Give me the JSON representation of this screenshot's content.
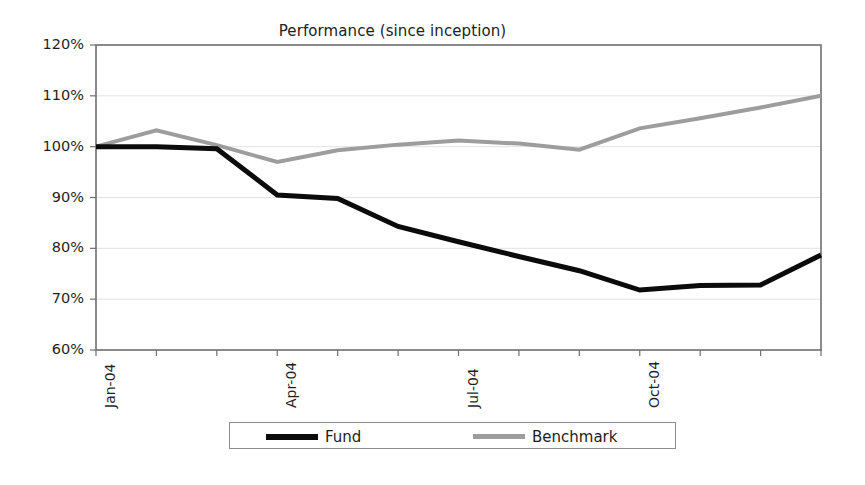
{
  "chart_data": {
    "type": "line",
    "title": "Performance (since inception)",
    "xlabel": "",
    "ylabel": "",
    "ylim": [
      60,
      120
    ],
    "ytick_labels": [
      "120%",
      "110%",
      "100%",
      "90%",
      "80%",
      "70%",
      "60%"
    ],
    "ytick_values": [
      120,
      110,
      100,
      90,
      80,
      70,
      60
    ],
    "grid": true,
    "legend_position": "bottom",
    "x": [
      "Jan-04",
      "Feb-04",
      "Mar-04",
      "Apr-04",
      "May-04",
      "Jun-04",
      "Jul-04",
      "Aug-04",
      "Sep-04",
      "Oct-04",
      "Nov-04",
      "Dec-04",
      "Jan-05"
    ],
    "xtick_labels_shown": [
      "Jan-04",
      "Apr-04",
      "Jul-04",
      "Oct-04"
    ],
    "xtick_labels_shown_index": [
      0,
      3,
      6,
      9
    ],
    "series": [
      {
        "name": "Fund",
        "color": "#0b0b0b",
        "width": 5,
        "values": [
          100.0,
          100.0,
          99.6,
          90.5,
          89.8,
          84.3,
          81.3,
          78.4,
          75.6,
          71.8,
          72.7,
          72.8,
          78.7
        ]
      },
      {
        "name": "Benchmark",
        "color": "#9d9d9d",
        "width": 4,
        "values": [
          100.0,
          103.2,
          100.3,
          97.0,
          99.3,
          100.4,
          101.2,
          100.6,
          99.4,
          103.6,
          105.6,
          107.7,
          110.0
        ]
      }
    ]
  },
  "legend": {
    "entries": [
      {
        "label": "Fund"
      },
      {
        "label": "Benchmark"
      }
    ]
  },
  "axis": {
    "frame_color": "#6f6f6f",
    "grid_color": "#e2e2e2"
  }
}
